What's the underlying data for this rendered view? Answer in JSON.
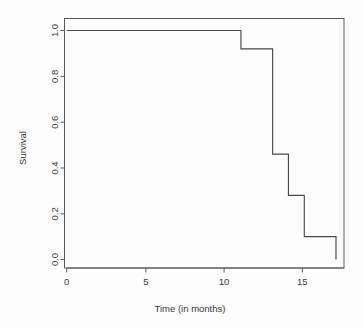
{
  "chart_data": {
    "type": "line",
    "subtype": "kaplan-meier-step",
    "title": "",
    "xlabel": "Time (in months)",
    "ylabel": "Survival",
    "xlim": [
      -0.35,
      17.8
    ],
    "ylim": [
      -0.03,
      1.04
    ],
    "grid": false,
    "legend": null,
    "xticks": [
      0,
      5,
      10,
      15
    ],
    "xtick_labels": [
      "0",
      "5",
      "10",
      "15"
    ],
    "yticks": [
      0.0,
      0.2,
      0.4,
      0.6,
      0.8,
      1.0
    ],
    "ytick_labels": [
      "0.0",
      "0.2",
      "0.4",
      "0.6",
      "0.8",
      "1.0"
    ],
    "series": [
      {
        "name": "Survival",
        "x": [
          0,
          11,
          11,
          13,
          13,
          14,
          14,
          15,
          15,
          17,
          17
        ],
        "y": [
          1.0,
          1.0,
          0.92,
          0.92,
          0.46,
          0.46,
          0.28,
          0.28,
          0.1,
          0.1,
          0.0
        ],
        "steps": [
          {
            "time": 0,
            "survival": 1.0
          },
          {
            "time": 11,
            "survival": 0.92
          },
          {
            "time": 13,
            "survival": 0.46
          },
          {
            "time": 14,
            "survival": 0.28
          },
          {
            "time": 15,
            "survival": 0.1
          },
          {
            "time": 17,
            "survival": 0.0
          }
        ],
        "color": "#4a4a4a"
      }
    ]
  },
  "axes": {
    "x_title": "Time (in months)",
    "y_title": "Survival",
    "x_tick_labels": [
      "0",
      "5",
      "10",
      "15"
    ],
    "y_tick_labels": [
      "0.0",
      "0.2",
      "0.4",
      "0.6",
      "0.8",
      "1.0"
    ]
  },
  "style": {
    "background": "#fdfdfd",
    "axis_color": "#5a5a5a",
    "curve_color": "#4a4a4a",
    "text_color": "#3a3a3a"
  }
}
